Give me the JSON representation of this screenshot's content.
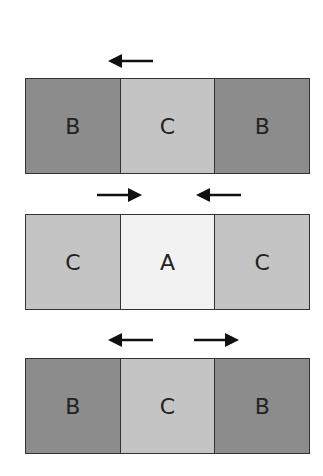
{
  "colors": {
    "A": "#f2f2f2",
    "B": "#8c8c8c",
    "C": "#c4c4c4",
    "arrow": "#111111"
  },
  "rows": [
    {
      "cells": [
        {
          "label": "B",
          "type": "B"
        },
        {
          "label": "C",
          "type": "C"
        },
        {
          "label": "B",
          "type": "B"
        }
      ],
      "arrows": [
        {
          "direction": "left",
          "x": 108,
          "y": 54
        }
      ]
    },
    {
      "cells": [
        {
          "label": "C",
          "type": "C"
        },
        {
          "label": "A",
          "type": "A"
        },
        {
          "label": "C",
          "type": "C"
        }
      ],
      "arrows": [
        {
          "direction": "right",
          "x": 97,
          "y": 189
        },
        {
          "direction": "left",
          "x": 196,
          "y": 189
        }
      ]
    },
    {
      "cells": [
        {
          "label": "B",
          "type": "B"
        },
        {
          "label": "C",
          "type": "C"
        },
        {
          "label": "B",
          "type": "B"
        }
      ],
      "arrows": [
        {
          "direction": "left",
          "x": 108,
          "y": 334
        },
        {
          "direction": "right",
          "x": 194,
          "y": 334
        }
      ]
    }
  ]
}
